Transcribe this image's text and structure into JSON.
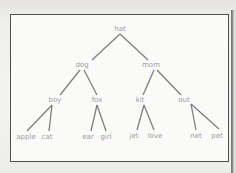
{
  "diagram": {
    "type": "binary-tree",
    "colors": {
      "edge": "#7e7e7e",
      "label": "#9d9d9d",
      "frame": "#4f4f4f",
      "background": "#fafaf8"
    },
    "nodes": [
      {
        "id": "hat",
        "label": "hat",
        "x": 120,
        "y": 31
      },
      {
        "id": "dog",
        "label": "dog",
        "x": 82,
        "y": 67
      },
      {
        "id": "mom",
        "label": "mom",
        "x": 151,
        "y": 67
      },
      {
        "id": "boy",
        "label": "boy",
        "x": 55,
        "y": 102
      },
      {
        "id": "fox",
        "label": "fox",
        "x": 97,
        "y": 102
      },
      {
        "id": "kit",
        "label": "kit",
        "x": 140,
        "y": 102
      },
      {
        "id": "out",
        "label": "out",
        "x": 184,
        "y": 102
      },
      {
        "id": "apple",
        "label": "apple",
        "x": 26,
        "y": 139
      },
      {
        "id": "cat",
        "label": "cat",
        "x": 47,
        "y": 139
      },
      {
        "id": "ear",
        "label": "ear",
        "x": 88,
        "y": 139
      },
      {
        "id": "girl",
        "label": "girl",
        "x": 106,
        "y": 139
      },
      {
        "id": "jet",
        "label": "jet",
        "x": 134,
        "y": 138
      },
      {
        "id": "love",
        "label": "love",
        "x": 155,
        "y": 138
      },
      {
        "id": "net",
        "label": "net",
        "x": 196,
        "y": 138
      },
      {
        "id": "pet",
        "label": "pet",
        "x": 217,
        "y": 138
      }
    ],
    "edges": [
      {
        "from": "hat",
        "to": "dog",
        "x1": 120,
        "y1": 34,
        "x2": 92,
        "y2": 60
      },
      {
        "from": "hat",
        "to": "mom",
        "x1": 120,
        "y1": 34,
        "x2": 148,
        "y2": 60
      },
      {
        "from": "dog",
        "to": "boy",
        "x1": 80,
        "y1": 70,
        "x2": 60,
        "y2": 95
      },
      {
        "from": "dog",
        "to": "fox",
        "x1": 84,
        "y1": 70,
        "x2": 97,
        "y2": 95
      },
      {
        "from": "mom",
        "to": "kit",
        "x1": 154,
        "y1": 70,
        "x2": 143,
        "y2": 95
      },
      {
        "from": "mom",
        "to": "out",
        "x1": 157,
        "y1": 70,
        "x2": 181,
        "y2": 95
      },
      {
        "from": "boy",
        "to": "apple",
        "x1": 52,
        "y1": 105,
        "x2": 27,
        "y2": 131
      },
      {
        "from": "boy",
        "to": "cat",
        "x1": 52,
        "y1": 105,
        "x2": 49,
        "y2": 131
      },
      {
        "from": "fox",
        "to": "ear",
        "x1": 97,
        "y1": 105,
        "x2": 91,
        "y2": 131
      },
      {
        "from": "fox",
        "to": "girl",
        "x1": 97,
        "y1": 105,
        "x2": 106,
        "y2": 131
      },
      {
        "from": "kit",
        "to": "jet",
        "x1": 144,
        "y1": 105,
        "x2": 137,
        "y2": 130
      },
      {
        "from": "kit",
        "to": "love",
        "x1": 144,
        "y1": 105,
        "x2": 154,
        "y2": 130
      },
      {
        "from": "out",
        "to": "net",
        "x1": 191,
        "y1": 104,
        "x2": 196,
        "y2": 130
      },
      {
        "from": "out",
        "to": "pet",
        "x1": 191,
        "y1": 104,
        "x2": 219,
        "y2": 129
      }
    ]
  }
}
